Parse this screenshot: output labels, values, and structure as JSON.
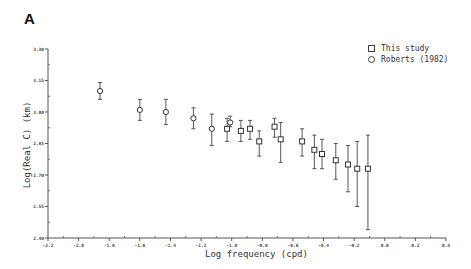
{
  "panel_label": "A",
  "chart_data": {
    "type": "scatter",
    "title": "",
    "xlabel": "Log frequency (cpd)",
    "ylabel": "Log(Real C) (km)",
    "xlim": [
      -2.2,
      0.4
    ],
    "ylim": [
      2.4,
      3.3
    ],
    "x_ticks": [
      -2.2,
      -2.0,
      -1.8,
      -1.6,
      -1.4,
      -1.2,
      -1.0,
      -0.8,
      -0.6,
      -0.4,
      -0.2,
      0.0,
      0.2,
      0.4
    ],
    "x_tick_labels": [
      "-2.2",
      "-2.0",
      "-1.8",
      "-1.6",
      "-1.4",
      "-1.2",
      "-1.0",
      "-0.8",
      "-0.6",
      "-0.4",
      "-0.2",
      "0.0",
      "0.2",
      "0.4"
    ],
    "y_ticks": [
      2.4,
      2.55,
      2.7,
      2.85,
      3.0,
      3.15,
      3.3
    ],
    "y_tick_labels": [
      "2.40",
      "2.55",
      "2.70",
      "2.85",
      "3.00",
      "3.15",
      "3.30"
    ],
    "grid": false,
    "legend_position": "upper right",
    "legend": [
      {
        "marker": "square",
        "label": "This study"
      },
      {
        "marker": "circle",
        "label": "Roberts (1982)"
      }
    ],
    "series": [
      {
        "name": "This study",
        "marker": "square",
        "points": [
          {
            "x": -1.03,
            "y": 2.92,
            "ylo": 2.86,
            "yhi": 2.97
          },
          {
            "x": -0.94,
            "y": 2.91,
            "ylo": 2.86,
            "yhi": 2.96
          },
          {
            "x": -0.88,
            "y": 2.92,
            "ylo": 2.87,
            "yhi": 2.96
          },
          {
            "x": -0.82,
            "y": 2.86,
            "ylo": 2.79,
            "yhi": 2.91
          },
          {
            "x": -0.72,
            "y": 2.93,
            "ylo": 2.88,
            "yhi": 2.97
          },
          {
            "x": -0.68,
            "y": 2.87,
            "ylo": 2.76,
            "yhi": 2.95
          },
          {
            "x": -0.54,
            "y": 2.86,
            "ylo": 2.79,
            "yhi": 2.92
          },
          {
            "x": -0.46,
            "y": 2.82,
            "ylo": 2.73,
            "yhi": 2.89
          },
          {
            "x": -0.41,
            "y": 2.8,
            "ylo": 2.73,
            "yhi": 2.87
          },
          {
            "x": -0.32,
            "y": 2.77,
            "ylo": 2.68,
            "yhi": 2.85
          },
          {
            "x": -0.24,
            "y": 2.75,
            "ylo": 2.62,
            "yhi": 2.84
          },
          {
            "x": -0.18,
            "y": 2.73,
            "ylo": 2.55,
            "yhi": 2.86
          },
          {
            "x": -0.11,
            "y": 2.73,
            "ylo": 2.44,
            "yhi": 2.89
          }
        ]
      },
      {
        "name": "Roberts (1982)",
        "marker": "circle",
        "points": [
          {
            "x": -1.86,
            "y": 3.1,
            "ylo": 3.06,
            "yhi": 3.14
          },
          {
            "x": -1.6,
            "y": 3.01,
            "ylo": 2.96,
            "yhi": 3.06
          },
          {
            "x": -1.43,
            "y": 3.0,
            "ylo": 2.94,
            "yhi": 3.06
          },
          {
            "x": -1.25,
            "y": 2.97,
            "ylo": 2.92,
            "yhi": 3.02
          },
          {
            "x": -1.13,
            "y": 2.92,
            "ylo": 2.84,
            "yhi": 2.99
          },
          {
            "x": -1.01,
            "y": 2.95,
            "ylo": 2.93,
            "yhi": 2.98
          }
        ]
      }
    ]
  }
}
